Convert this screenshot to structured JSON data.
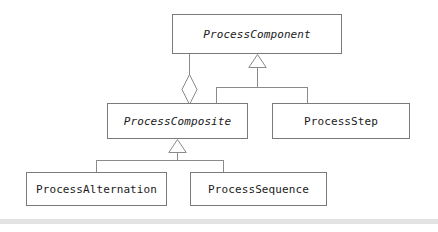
{
  "diagram": {
    "type": "uml-class-diagram",
    "pattern": "Composite",
    "background_color": "#ffffff",
    "box_border_color": "#7a7a7a",
    "edge_color": "#8a8a8a",
    "text_color": "#1a1a1a",
    "footer_band_color": "#e3e3e3",
    "classes": [
      {
        "id": "process-component",
        "label": "ProcessComponent",
        "abstract": true,
        "x": 172,
        "y": 14,
        "width": 170,
        "height": 40
      },
      {
        "id": "process-composite",
        "label": "ProcessComposite",
        "abstract": true,
        "x": 107,
        "y": 103,
        "width": 141,
        "height": 36
      },
      {
        "id": "process-step",
        "label": "ProcessStep",
        "abstract": false,
        "x": 272,
        "y": 103,
        "width": 138,
        "height": 36
      },
      {
        "id": "process-alternation",
        "label": "ProcessAlternation",
        "abstract": false,
        "x": 26,
        "y": 172,
        "width": 141,
        "height": 34
      },
      {
        "id": "process-sequence",
        "label": "ProcessSequence",
        "abstract": false,
        "x": 190,
        "y": 172,
        "width": 137,
        "height": 34
      }
    ],
    "relationships": [
      {
        "id": "aggregation-component-composite",
        "type": "aggregation",
        "marker": "hollow-diamond",
        "from": "process-composite",
        "to": "process-component"
      },
      {
        "id": "generalization-composite-component",
        "type": "generalization",
        "marker": "hollow-triangle",
        "from": "process-composite",
        "to": "process-component"
      },
      {
        "id": "generalization-step-component",
        "type": "generalization",
        "marker": "hollow-triangle",
        "from": "process-step",
        "to": "process-component"
      },
      {
        "id": "generalization-alternation-composite",
        "type": "generalization",
        "marker": "hollow-triangle",
        "from": "process-alternation",
        "to": "process-composite"
      },
      {
        "id": "generalization-sequence-composite",
        "type": "generalization",
        "marker": "hollow-triangle",
        "from": "process-sequence",
        "to": "process-composite"
      }
    ]
  }
}
